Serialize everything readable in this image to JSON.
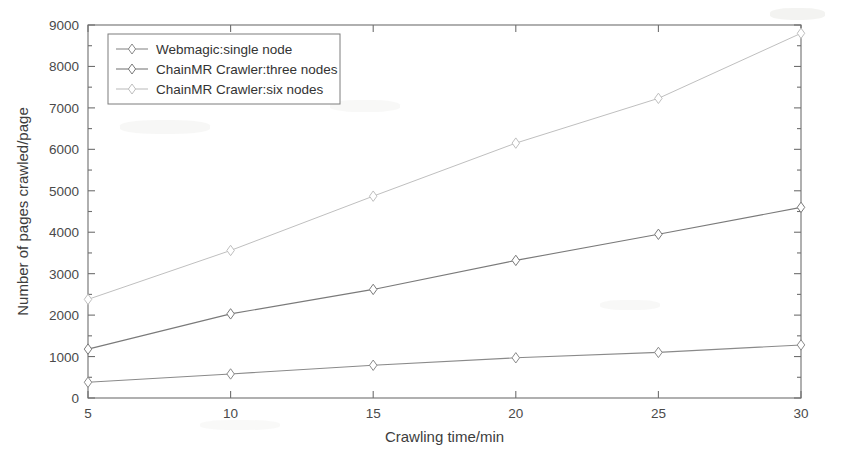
{
  "chart_data": {
    "type": "line",
    "title": "",
    "xlabel": "Crawling time/min",
    "ylabel": "Number of pages crawled/page",
    "x": [
      5,
      10,
      15,
      20,
      25,
      30
    ],
    "xticklabels": [
      "5",
      "10",
      "15",
      "20",
      "25",
      "30"
    ],
    "yticklabels": [
      "0",
      "1000",
      "2000",
      "3000",
      "4000",
      "5000",
      "6000",
      "7000",
      "8000",
      "9000"
    ],
    "yticks": [
      0,
      1000,
      2000,
      3000,
      4000,
      5000,
      6000,
      7000,
      8000,
      9000
    ],
    "xlim": [
      5,
      30
    ],
    "ylim": [
      0,
      9000
    ],
    "grid": false,
    "legend_position": "upper left",
    "series": [
      {
        "name": "Webmagic:single node",
        "values": [
          380,
          580,
          790,
          970,
          1100,
          1280
        ],
        "color": "#8a8a8a",
        "marker": "diamond",
        "linestyle": "solid"
      },
      {
        "name": "ChainMR Crawler:three nodes",
        "values": [
          1180,
          2030,
          2620,
          3320,
          3950,
          4600
        ],
        "color": "#7a7a7a",
        "marker": "diamond",
        "linestyle": "solid"
      },
      {
        "name": "ChainMR Crawler:six nodes",
        "values": [
          2380,
          3560,
          4870,
          6150,
          7230,
          8800
        ],
        "color": "#bfbfbf",
        "marker": "diamond",
        "linestyle": "solid"
      }
    ]
  },
  "axis": {
    "x_label": "Crawling time/min",
    "y_label": "Number of pages crawled/page"
  },
  "legend": {
    "items": [
      {
        "label": "Webmagic:single node"
      },
      {
        "label": "ChainMR Crawler:three nodes"
      },
      {
        "label": "ChainMR Crawler:six nodes"
      }
    ]
  }
}
